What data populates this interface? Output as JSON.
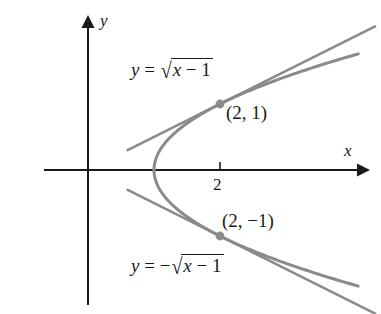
{
  "figure": {
    "background_color": "#ffffff",
    "axis_color": "#1a1a1a",
    "curve_color": "#8a8a8a",
    "tangent_color": "#8a8a8a",
    "point_color": "#8a8a8a",
    "text_color": "#1a1a1a"
  },
  "axes": {
    "x_label": "x",
    "y_label": "y",
    "origin_px": [
      88,
      170
    ],
    "unit_px": 66,
    "x_tick_values": [
      "2"
    ],
    "y_tick_values": []
  },
  "labels": {
    "upper_equation": {
      "y": "y",
      "equals": "=",
      "radicand_x": "x",
      "minus": "−",
      "radicand_one": "1",
      "sign": "",
      "surd": "√"
    },
    "lower_equation": {
      "y": "y",
      "equals": "=",
      "radicand_x": "x",
      "minus": "−",
      "radicand_one": "1",
      "sign": "−",
      "surd": "√"
    },
    "upper_point": "(2, 1)",
    "lower_point": "(2, −1)",
    "x_tick": "2"
  },
  "chart_data": {
    "type": "line",
    "title": "",
    "xlabel": "x",
    "ylabel": "y",
    "xlim": [
      -0.7,
      5.2
    ],
    "ylim": [
      -2.2,
      2.2
    ],
    "grid": false,
    "legend": "none",
    "series": [
      {
        "name": "y = sqrt(x - 1)",
        "kind": "curve",
        "expression": "y = sqrt(x - 1)",
        "points": [
          [
            1.0,
            0.0
          ],
          [
            1.05,
            0.224
          ],
          [
            1.15,
            0.387
          ],
          [
            1.3,
            0.548
          ],
          [
            1.5,
            0.707
          ],
          [
            1.75,
            0.866
          ],
          [
            2.0,
            1.0
          ],
          [
            2.5,
            1.225
          ],
          [
            3.0,
            1.414
          ],
          [
            3.5,
            1.581
          ],
          [
            4.0,
            1.732
          ],
          [
            4.4,
            1.844
          ]
        ]
      },
      {
        "name": "y = -sqrt(x - 1)",
        "kind": "curve",
        "expression": "y = -sqrt(x - 1)",
        "points": [
          [
            1.0,
            0.0
          ],
          [
            1.05,
            -0.224
          ],
          [
            1.15,
            -0.387
          ],
          [
            1.3,
            -0.548
          ],
          [
            1.5,
            -0.707
          ],
          [
            1.75,
            -0.866
          ],
          [
            2.0,
            -1.0
          ],
          [
            2.5,
            -1.225
          ],
          [
            3.0,
            -1.414
          ],
          [
            3.5,
            -1.581
          ],
          [
            4.0,
            -1.732
          ],
          [
            4.4,
            -1.844
          ]
        ]
      },
      {
        "name": "tangent at (2, 1)",
        "kind": "line",
        "expression": "y = 1 + (x - 2)/2",
        "slope": 0.5,
        "points": [
          [
            0.6,
            0.3
          ],
          [
            4.35,
            2.175
          ]
        ]
      },
      {
        "name": "tangent at (2, -1)",
        "kind": "line",
        "expression": "y = -1 - (x - 2)/2",
        "slope": -0.5,
        "points": [
          [
            0.6,
            -0.3
          ],
          [
            4.35,
            -2.175
          ]
        ]
      }
    ],
    "points_of_interest": [
      {
        "label": "(2, 1)",
        "x": 2,
        "y": 1
      },
      {
        "label": "(2, -1)",
        "x": 2,
        "y": -1
      }
    ],
    "annotations": [
      {
        "text": "y = sqrt(x - 1)",
        "x": 1.0,
        "y": 1.55
      },
      {
        "text": "y = -sqrt(x - 1)",
        "x": 1.0,
        "y": -1.62
      }
    ]
  }
}
